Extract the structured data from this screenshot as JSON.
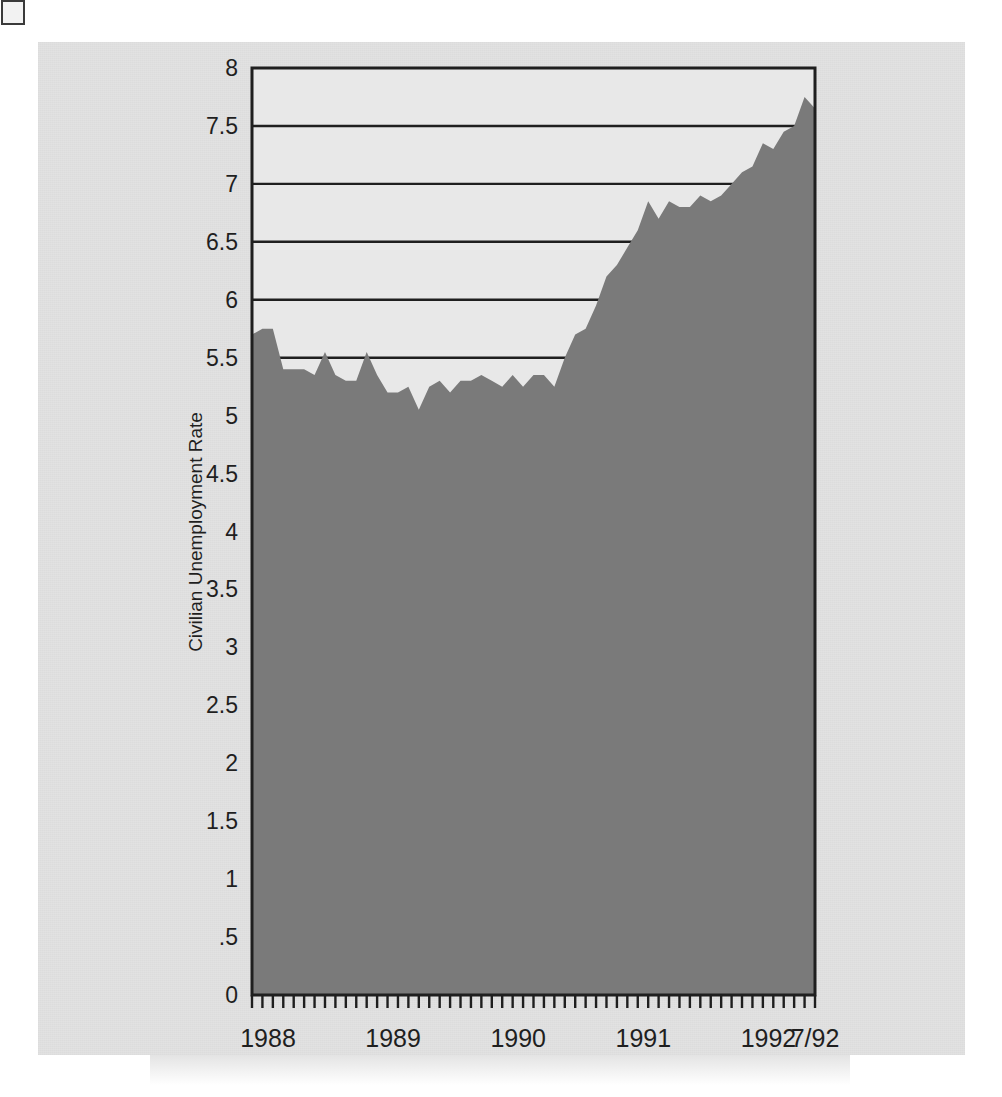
{
  "figure": {
    "background_color": "#e2e2e2",
    "plot_background_color": "#e8e8e8",
    "area_fill_color": "#7a7a7a",
    "axis_color": "#1f1f1f",
    "y_axis_title": "Civilian Unemployment Rate"
  },
  "chart_data": {
    "type": "area",
    "title": "",
    "subtitle": "",
    "xlabel": "",
    "ylabel": "Civilian Unemployment Rate",
    "ylim": [
      0,
      8
    ],
    "xlim": [
      "1988-01",
      "1992-07"
    ],
    "grid": true,
    "gridlines_axis": "y",
    "legend": "none",
    "y_tick_labels": [
      "0",
      ".5",
      "1",
      "1.5",
      "2",
      "2.5",
      "3",
      "3.5",
      "4",
      "4.5",
      "5",
      "5.5",
      "6",
      "6.5",
      "7",
      "7.5",
      "8"
    ],
    "y_tick_values": [
      0,
      0.5,
      1,
      1.5,
      2,
      2.5,
      3,
      3.5,
      4,
      4.5,
      5,
      5.5,
      6,
      6.5,
      7,
      7.5,
      8
    ],
    "x_tick_labels": [
      "1988",
      "1989",
      "1990",
      "1991",
      "1992",
      "7/92"
    ],
    "x_tick_positions": [
      0,
      12,
      24,
      36,
      48,
      54
    ],
    "minor_tick_interval_months": 1,
    "series": [
      {
        "name": "Civilian Unemployment Rate",
        "units": "percent",
        "x": [
          "1988-01",
          "1988-02",
          "1988-03",
          "1988-04",
          "1988-05",
          "1988-06",
          "1988-07",
          "1988-08",
          "1988-09",
          "1988-10",
          "1988-11",
          "1988-12",
          "1989-01",
          "1989-02",
          "1989-03",
          "1989-04",
          "1989-05",
          "1989-06",
          "1989-07",
          "1989-08",
          "1989-09",
          "1989-10",
          "1989-11",
          "1989-12",
          "1990-01",
          "1990-02",
          "1990-03",
          "1990-04",
          "1990-05",
          "1990-06",
          "1990-07",
          "1990-08",
          "1990-09",
          "1990-10",
          "1990-11",
          "1990-12",
          "1991-01",
          "1991-02",
          "1991-03",
          "1991-04",
          "1991-05",
          "1991-06",
          "1991-07",
          "1991-08",
          "1991-09",
          "1991-10",
          "1991-11",
          "1991-12",
          "1992-01",
          "1992-02",
          "1992-03",
          "1992-04",
          "1992-05",
          "1992-06",
          "1992-07"
        ],
        "values": [
          5.7,
          5.75,
          5.75,
          5.4,
          5.4,
          5.4,
          5.35,
          5.55,
          5.35,
          5.3,
          5.3,
          5.55,
          5.35,
          5.2,
          5.2,
          5.25,
          5.05,
          5.25,
          5.3,
          5.2,
          5.3,
          5.3,
          5.35,
          5.3,
          5.25,
          5.35,
          5.25,
          5.35,
          5.35,
          5.25,
          5.5,
          5.7,
          5.75,
          5.95,
          6.2,
          6.3,
          6.45,
          6.6,
          6.85,
          6.7,
          6.85,
          6.8,
          6.8,
          6.9,
          6.85,
          6.9,
          7.0,
          7.1,
          7.15,
          7.35,
          7.3,
          7.45,
          7.5,
          7.75,
          7.65
        ]
      }
    ]
  }
}
